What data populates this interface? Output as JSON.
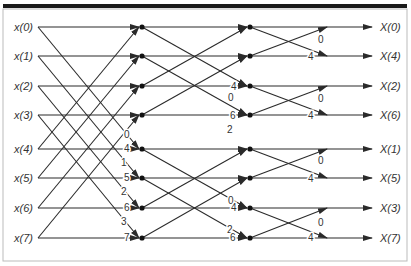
{
  "diagram": {
    "type": "8-point decimation-in-frequency FFT butterfly",
    "inputs": [
      "x(0)",
      "x(1)",
      "x(2)",
      "x(3)",
      "x(4)",
      "x(5)",
      "x(6)",
      "x(7)"
    ],
    "outputs": [
      "X(0)",
      "X(4)",
      "X(2)",
      "X(6)",
      "X(1)",
      "X(5)",
      "X(3)",
      "X(7)"
    ],
    "stage1_twiddles": [
      "0",
      "4",
      "1",
      "5",
      "2",
      "6",
      "3",
      "7"
    ],
    "stage2_twiddles": [
      "0",
      "4",
      "2",
      "6",
      "0",
      "4",
      "2",
      "6"
    ],
    "stage3_twiddles": [
      "0",
      "4",
      "0",
      "4",
      "0",
      "4",
      "0",
      "4"
    ],
    "colors": {
      "line": "#2a2a2a",
      "border": "#1a1a1a",
      "frame": "#bbbbbb"
    }
  }
}
